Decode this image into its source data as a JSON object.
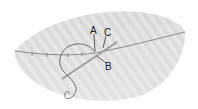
{
  "diagram": {
    "type": "illustration",
    "colors": {
      "tissue_fill": "#d6d6d6",
      "tissue_stripe": "#e2e2e2",
      "incision_line": "#8a8a8a",
      "thread": "#7a7a7a",
      "label_text": "#1a1a1a"
    },
    "labels": [
      {
        "id": "A",
        "text": "A"
      },
      {
        "id": "B",
        "text": "B"
      },
      {
        "id": "C",
        "text": "C"
      }
    ]
  }
}
